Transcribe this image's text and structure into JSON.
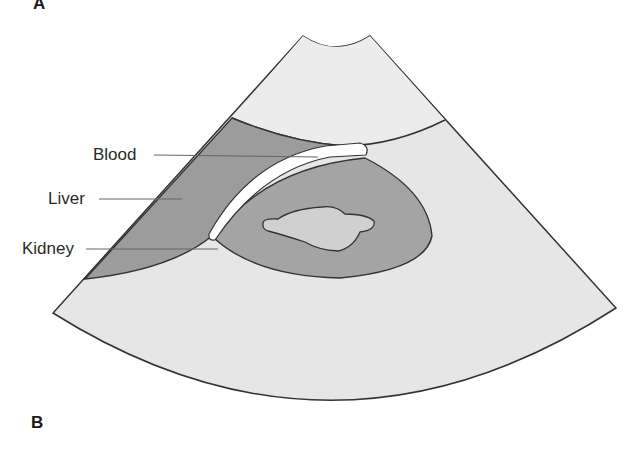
{
  "figure": {
    "panel_top_label": "A",
    "panel_bottom_label": "B",
    "labels": {
      "blood": "Blood",
      "liver": "Liver",
      "kidney": "Kidney"
    }
  },
  "colors": {
    "background": "#ffffff",
    "fan_light": "#e4e4e4",
    "near_field": "#ebebeb",
    "liver_dark": "#9a9a9a",
    "kidney_cortex": "#a3a3a3",
    "kidney_sinus": "#cfcfcf",
    "blood_vessel": "#ffffff",
    "outline": "#333333",
    "leader_line": "#555555"
  }
}
